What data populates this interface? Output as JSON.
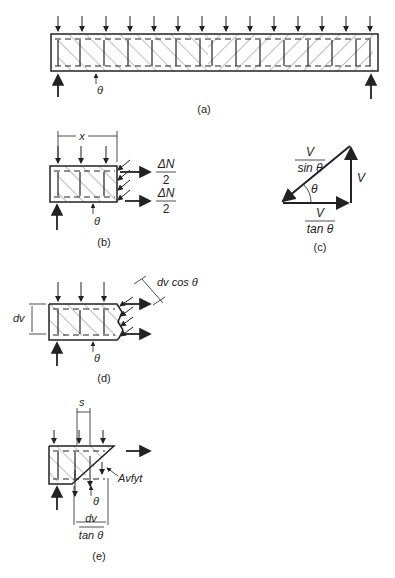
{
  "figure": {
    "panels": [
      {
        "id": "a",
        "caption": "(a)",
        "description": "Simply supported beam with uniform load showing diagonal compression field and stirrups",
        "labels": {
          "angle": "θ"
        }
      },
      {
        "id": "b",
        "caption": "(b)",
        "description": "Free body of beam segment of length x",
        "labels": {
          "length": "x",
          "angle": "θ",
          "force_top_num": "ΔN",
          "force_top_den": "2",
          "force_bot_num": "ΔN",
          "force_bot_den": "2"
        }
      },
      {
        "id": "c",
        "caption": "(c)",
        "description": "Force triangle",
        "labels": {
          "hyp_num": "V",
          "hyp_den": "sin θ",
          "vertical": "V",
          "base_num": "V",
          "base_den": "tan θ",
          "angle": "θ"
        }
      },
      {
        "id": "d",
        "caption": "(d)",
        "description": "Free body cut along diagonal strut",
        "labels": {
          "depth": "dv",
          "width": "dv cos θ",
          "angle": "θ"
        }
      },
      {
        "id": "e",
        "caption": "(e)",
        "description": "Free body cut along crack showing stirrup forces",
        "labels": {
          "spacing": "s",
          "stirrup_force": "Avfyt",
          "angle": "θ",
          "proj_num": "dv",
          "proj_den": "tan θ"
        }
      }
    ]
  }
}
